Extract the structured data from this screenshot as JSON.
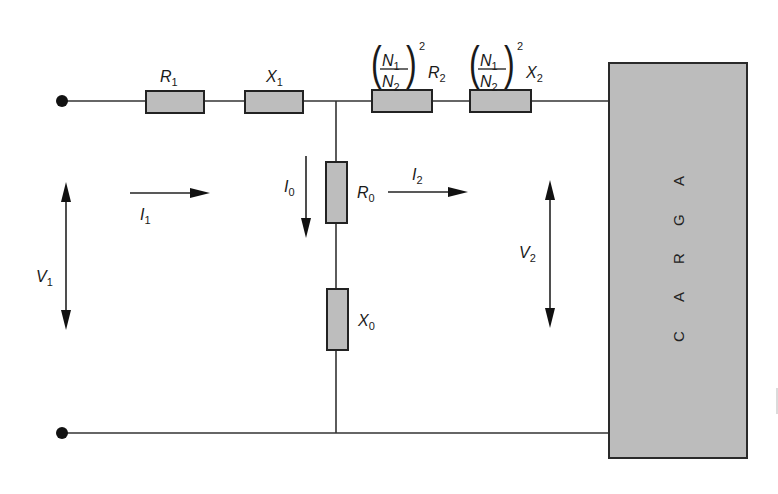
{
  "diagram": {
    "colors": {
      "component_fill": "#bdbdbd",
      "load_fill": "#bcbcbc",
      "line": "#222222",
      "background": "#ffffff"
    },
    "series_components": [
      {
        "id": "R1",
        "symbol": "R",
        "sub": "1"
      },
      {
        "id": "X1",
        "symbol": "X",
        "sub": "1"
      },
      {
        "id": "R2_ref",
        "ratio_num": "N",
        "ratio_num_sub": "1",
        "ratio_den": "N",
        "ratio_den_sub": "2",
        "exp": "2",
        "symbol": "R",
        "sub": "2"
      },
      {
        "id": "X2_ref",
        "ratio_num": "N",
        "ratio_num_sub": "1",
        "ratio_den": "N",
        "ratio_den_sub": "2",
        "exp": "2",
        "symbol": "X",
        "sub": "2"
      }
    ],
    "shunt_components": [
      {
        "id": "R0",
        "symbol": "R",
        "sub": "0"
      },
      {
        "id": "X0",
        "symbol": "X",
        "sub": "0"
      }
    ],
    "quantities": {
      "V1": {
        "symbol": "V",
        "sub": "1"
      },
      "V2": {
        "symbol": "V",
        "sub": "2"
      },
      "I1": {
        "symbol": "I",
        "sub": "1"
      },
      "I0": {
        "symbol": "I",
        "sub": "0"
      },
      "I2": {
        "symbol": "I",
        "sub": "2"
      }
    },
    "load": {
      "label_letters": [
        "C",
        "A",
        "R",
        "G",
        "A"
      ]
    }
  }
}
